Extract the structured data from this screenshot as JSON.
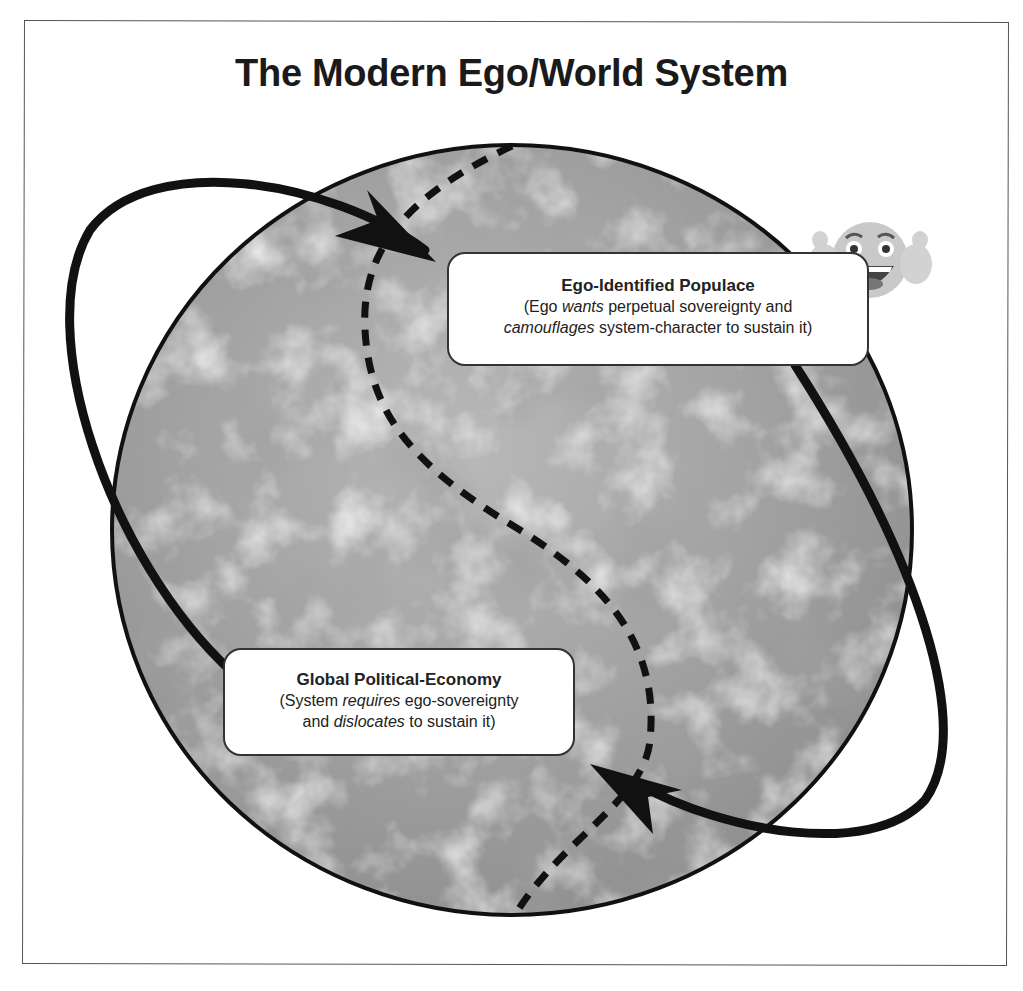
{
  "title": "The Modern Ego/World System",
  "nodes": {
    "ego_populace": {
      "heading": "Ego-Identified Populace",
      "line1_pre": "(Ego ",
      "line1_em": "wants",
      "line1_post": " perpetual sovereignty and",
      "line2_em": "camouflages",
      "line2_post": " system-character to sustain it)"
    },
    "global_economy": {
      "heading": "Global Political-Economy",
      "line1_pre": "(System ",
      "line1_em": "requires",
      "line1_post": " ego-sovereignty",
      "line2_pre": "and ",
      "line2_em": "dislocates",
      "line2_post": " to sustain it)"
    }
  },
  "icons": {
    "globe": "earth-globe-grayscale",
    "emoji": "grinning-face-thumbs-up-emoji"
  },
  "colors": {
    "stroke": "#111111",
    "globe_fill": "#9c9c9c",
    "frame": "#555555",
    "box_fill": "#ffffff"
  }
}
